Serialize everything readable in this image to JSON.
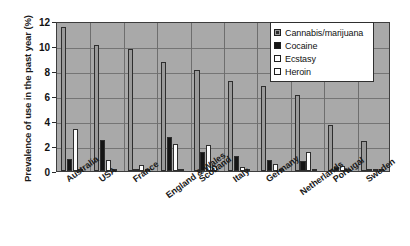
{
  "chart_data": {
    "type": "bar",
    "title": "",
    "xlabel": "",
    "ylabel": "Prevalence of use in the past year (%)",
    "ylim": [
      0,
      12
    ],
    "yticks": [
      0,
      2,
      4,
      6,
      8,
      10,
      12
    ],
    "grid": true,
    "legend_position": "top-right",
    "categories": [
      "Australia",
      "USA",
      "France",
      "England & Wales",
      "Scotland",
      "Italy",
      "Germany",
      "Netherlands",
      "Portugal",
      "Sweden"
    ],
    "series": [
      {
        "name": "Cannabis/marijuana",
        "color": "#9a9a9a",
        "values": [
          11.5,
          10.1,
          9.8,
          8.7,
          8.1,
          7.2,
          6.8,
          6.1,
          3.7,
          2.4
        ]
      },
      {
        "name": "Cocaine",
        "color": "#151515",
        "values": [
          1.0,
          2.5,
          0.2,
          2.7,
          1.5,
          1.2,
          0.9,
          0.8,
          0.3,
          0.2
        ]
      },
      {
        "name": "Ecstasy",
        "color": "#ffffff",
        "values": [
          3.4,
          0.9,
          0.5,
          2.2,
          2.1,
          0.3,
          0.6,
          1.5,
          0.4,
          0.1
        ]
      },
      {
        "name": "Heroin",
        "color": "#ffffff",
        "values": [
          0.2,
          0.2,
          0.1,
          0.2,
          0.4,
          0.1,
          0.1,
          0.1,
          0.1,
          0.1
        ]
      }
    ]
  },
  "axis": {
    "y_title": "Prevalence of use in the past year (%)",
    "y_tick_labels": [
      "12",
      "10",
      "8",
      "6",
      "4",
      "2",
      "0"
    ]
  },
  "legend": {
    "entries": [
      {
        "label": "Cannabis/marijuana",
        "swatch": "cannabis"
      },
      {
        "label": "Cocaine",
        "swatch": "cocaine"
      },
      {
        "label": "Ecstasy",
        "swatch": "ecstasy"
      },
      {
        "label": "Heroin",
        "swatch": "heroin"
      }
    ]
  }
}
